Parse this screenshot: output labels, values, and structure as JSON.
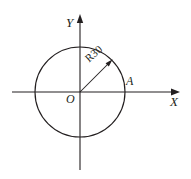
{
  "figure": {
    "labels": {
      "y_axis": "Y",
      "x_axis": "X",
      "origin": "O",
      "point_a": "A",
      "radius_dimension": "R30"
    },
    "colors": {
      "stroke": "#231f20",
      "background": "#ffffff"
    },
    "geometry": {
      "center": {
        "x": 80,
        "y": 92
      },
      "radius_px": 45,
      "radius_value": 30,
      "point_a": {
        "x": 125,
        "y": 92
      },
      "radius_arrow_angle_deg": 45,
      "x_axis": {
        "start_x": 12,
        "end_x": 180,
        "y": 92
      },
      "y_axis": {
        "x": 80,
        "start_y": 170,
        "end_y": 14
      }
    }
  }
}
